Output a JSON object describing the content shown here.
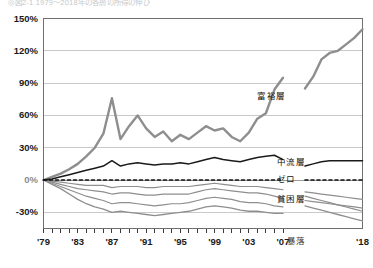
{
  "caption": "◎図2-1 1979～2018年の各層の所得の伸び",
  "chart_data": {
    "type": "line",
    "title": "",
    "xlabel": "",
    "ylabel": "",
    "ylim": [
      -45,
      150
    ],
    "xlim": [
      1979,
      2018
    ],
    "grid": true,
    "legend_position": "inline-annotations",
    "y_ticks": [
      "150%",
      "120%",
      "90%",
      "60%",
      "30%",
      "0%",
      "-30%"
    ],
    "y_tick_values": [
      150,
      120,
      90,
      60,
      30,
      0,
      -30
    ],
    "x_ticks": [
      "'79",
      "'83",
      "'87",
      "'91",
      "'95",
      "'99",
      "'03",
      "'07",
      "暴落",
      "'18"
    ],
    "x_tick_values": [
      1979,
      1983,
      1987,
      1991,
      1995,
      1999,
      2003,
      2007,
      2011,
      2018
    ],
    "annotations": [
      {
        "name": "wealthy",
        "label": "富裕層",
        "x": 2004,
        "y": 78
      },
      {
        "name": "middle",
        "label": "中流層",
        "x": 2007.6,
        "y": 17
      },
      {
        "name": "zero",
        "label": "ゼロ",
        "x": 2007.6,
        "y": 1
      },
      {
        "name": "poor",
        "label": "貧困層",
        "x": 2007.6,
        "y": -18
      }
    ],
    "series": [
      {
        "name": "富裕層",
        "color": "#8e8e8e",
        "width": 2.4,
        "dash": "none",
        "x": [
          1979,
          1980,
          1981,
          1982,
          1983,
          1984,
          1985,
          1986,
          1987,
          1988,
          1989,
          1990,
          1991,
          1992,
          1993,
          1994,
          1995,
          1996,
          1997,
          1998,
          1999,
          2000,
          2001,
          2002,
          2003,
          2004,
          2005,
          2006,
          2007,
          2011,
          2012,
          2013,
          2014,
          2015,
          2016,
          2017,
          2018
        ],
        "values": [
          0,
          3,
          6,
          10,
          15,
          22,
          30,
          43,
          76,
          38,
          50,
          60,
          48,
          40,
          45,
          36,
          42,
          38,
          44,
          50,
          46,
          48,
          40,
          36,
          44,
          57,
          62,
          84,
          95,
          85,
          96,
          112,
          118,
          120,
          126,
          132,
          140
        ]
      },
      {
        "name": "中流層",
        "color": "#1a1a1a",
        "width": 1.5,
        "dash": "none",
        "x": [
          1979,
          1980,
          1981,
          1982,
          1983,
          1984,
          1985,
          1986,
          1987,
          1988,
          1989,
          1990,
          1991,
          1992,
          1993,
          1994,
          1995,
          1996,
          1997,
          1998,
          1999,
          2000,
          2001,
          2002,
          2003,
          2004,
          2005,
          2006,
          2007,
          2011,
          2012,
          2013,
          2014,
          2015,
          2016,
          2017,
          2018
        ],
        "values": [
          0,
          1,
          3,
          5,
          7,
          9,
          11,
          13,
          18,
          13,
          15,
          16,
          15,
          14,
          15,
          15,
          16,
          15,
          17,
          19,
          21,
          19,
          18,
          17,
          19,
          21,
          22,
          23,
          19,
          13,
          15,
          17,
          18,
          18,
          18,
          18,
          18
        ]
      },
      {
        "name": "ゼロ",
        "color": "#111111",
        "width": 1.6,
        "dash": "3 3",
        "x": [
          1979,
          2007,
          2011,
          2018
        ],
        "values": [
          0,
          0,
          0,
          0
        ]
      },
      {
        "name": "貧困層上位",
        "color": "#8e8e8e",
        "width": 1.2,
        "dash": "none",
        "x": [
          1979,
          1980,
          1981,
          1982,
          1983,
          1984,
          1985,
          1986,
          1987,
          1988,
          1989,
          1990,
          1991,
          1992,
          1993,
          1994,
          1995,
          1996,
          1997,
          1998,
          1999,
          2000,
          2001,
          2002,
          2003,
          2004,
          2005,
          2006,
          2007,
          2011,
          2012,
          2013,
          2014,
          2015,
          2016,
          2017,
          2018
        ],
        "values": [
          0,
          -1,
          -2,
          -3,
          -4,
          -5,
          -5,
          -5,
          -7,
          -6,
          -6,
          -6,
          -7,
          -7,
          -6,
          -6,
          -6,
          -6,
          -5,
          -4,
          -3,
          -4,
          -5,
          -6,
          -6,
          -6,
          -7,
          -8,
          -9,
          -11,
          -12,
          -13,
          -14,
          -15,
          -16,
          -17,
          -18
        ]
      },
      {
        "name": "貧困層中位",
        "color": "#8e8e8e",
        "width": 1.2,
        "dash": "none",
        "x": [
          1979,
          1980,
          1981,
          1982,
          1983,
          1984,
          1985,
          1986,
          1987,
          1988,
          1989,
          1990,
          1991,
          1992,
          1993,
          1994,
          1995,
          1996,
          1997,
          1998,
          1999,
          2000,
          2001,
          2002,
          2003,
          2004,
          2005,
          2006,
          2007,
          2011,
          2012,
          2013,
          2014,
          2015,
          2016,
          2017,
          2018
        ],
        "values": [
          0,
          -2,
          -4,
          -6,
          -8,
          -9,
          -10,
          -11,
          -13,
          -12,
          -12,
          -13,
          -14,
          -14,
          -13,
          -13,
          -13,
          -13,
          -11,
          -9,
          -8,
          -9,
          -10,
          -11,
          -12,
          -12,
          -13,
          -15,
          -17,
          -19,
          -20,
          -21,
          -22,
          -23,
          -24,
          -25,
          -26
        ]
      },
      {
        "name": "貧困層下位",
        "color": "#8e8e8e",
        "width": 1.3,
        "dash": "none",
        "x": [
          1979,
          1980,
          1981,
          1982,
          1983,
          1984,
          1985,
          1986,
          1987,
          1988,
          1989,
          1990,
          1991,
          1992,
          1993,
          1994,
          1995,
          1996,
          1997,
          1998,
          1999,
          2000,
          2001,
          2002,
          2003,
          2004,
          2005,
          2006,
          2007,
          2011,
          2012,
          2013,
          2014,
          2015,
          2016,
          2017,
          2018
        ],
        "values": [
          0,
          -4,
          -8,
          -13,
          -18,
          -22,
          -25,
          -27,
          -30,
          -29,
          -30,
          -31,
          -32,
          -33,
          -32,
          -31,
          -30,
          -29,
          -27,
          -25,
          -24,
          -25,
          -26,
          -28,
          -29,
          -29,
          -30,
          -31,
          -31,
          -24,
          -26,
          -28,
          -30,
          -32,
          -34,
          -36,
          -38
        ]
      },
      {
        "name": "貧困層最下位",
        "color": "#8e8e8e",
        "width": 1.2,
        "dash": "none",
        "x": [
          1979,
          1980,
          1981,
          1982,
          1983,
          1984,
          1985,
          1986,
          1987,
          1988,
          1989,
          1990,
          1991,
          1992,
          1993,
          1994,
          1995,
          1996,
          1997,
          1998,
          1999,
          2000,
          2001,
          2002,
          2003,
          2004,
          2005,
          2006,
          2007,
          2011,
          2012,
          2013,
          2014,
          2015,
          2016,
          2017,
          2018
        ],
        "values": [
          0,
          -3,
          -6,
          -9,
          -12,
          -15,
          -17,
          -19,
          -22,
          -21,
          -21,
          -22,
          -23,
          -24,
          -23,
          -22,
          -22,
          -21,
          -19,
          -17,
          -16,
          -17,
          -18,
          -20,
          -21,
          -21,
          -22,
          -24,
          -25,
          -15,
          -17,
          -19,
          -21,
          -23,
          -25,
          -27,
          -29
        ]
      }
    ]
  }
}
